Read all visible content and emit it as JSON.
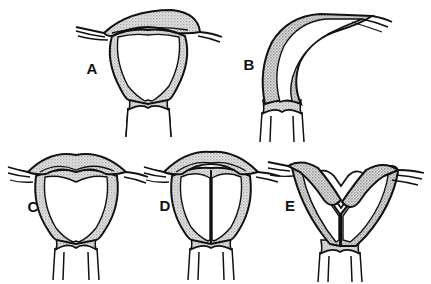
{
  "figure": {
    "kind": "medical-line-illustration",
    "background_color": "#ffffff",
    "ink_color": "#111111",
    "shading_color": "#d2d2d2",
    "shading_style": "stipple-halftone",
    "panel_count": 5,
    "caption": "",
    "title": ""
  },
  "panels": [
    {
      "id": "A",
      "label": "A",
      "label_x": 92,
      "label_y": 74,
      "description": "normal uterus with broad flat fundus and single triangular cavity",
      "fundus_shape": "flat-convex",
      "cavity": "single",
      "septum": "none",
      "orientation": "upright"
    },
    {
      "id": "B",
      "label": "B",
      "label_x": 249,
      "label_y": 70,
      "description": "uterus deviated and flexed laterally to the right with elongated narrow cavity",
      "fundus_shape": "tapered",
      "cavity": "single",
      "septum": "none",
      "orientation": "laterally-flexed"
    },
    {
      "id": "C",
      "label": "C",
      "label_x": 33,
      "label_y": 212,
      "description": "arcuate uterus with shallow saddle-shaped indentation of the fundus",
      "fundus_shape": "arcuate-saddle",
      "cavity": "single",
      "septum": "none",
      "orientation": "upright"
    },
    {
      "id": "D",
      "label": "D",
      "label_x": 165,
      "label_y": 211,
      "description": "septate uterus with thin midline septum dividing the cavity",
      "fundus_shape": "convex",
      "cavity": "divided",
      "septum": "complete-thin",
      "orientation": "upright"
    },
    {
      "id": "E",
      "label": "E",
      "label_x": 290,
      "label_y": 211,
      "description": "bicornuate uterus with deep V-shaped fundal cleft and two divergent horns",
      "fundus_shape": "deep-v-cleft",
      "cavity": "two-horns",
      "septum": "partial",
      "orientation": "upright"
    }
  ],
  "anatomy_parts": [
    "fundus",
    "uterine-horn",
    "fallopian-tube",
    "endometrial-cavity",
    "myometrial-wall",
    "cervix",
    "cervical-canal",
    "vagina"
  ]
}
